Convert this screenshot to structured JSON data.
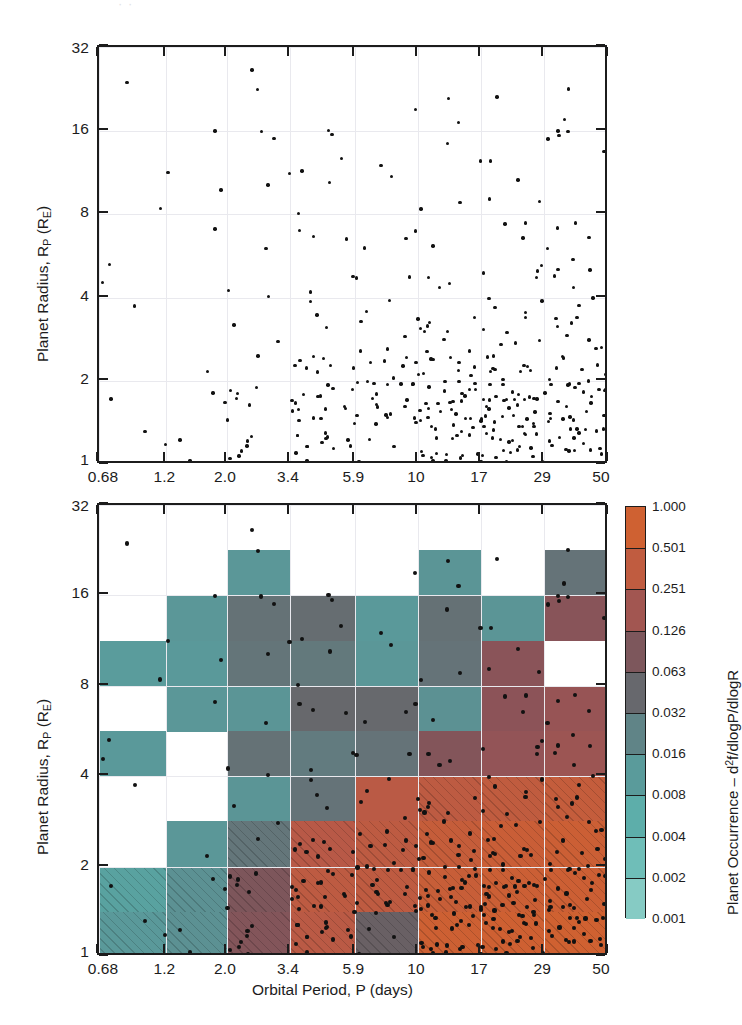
{
  "figure": {
    "panels": [
      {
        "id": "scatter-panel",
        "role": "planet radius vs orbital period scatter",
        "xlabel": "",
        "ylabel": "Planet Radius, R_P (R_E)"
      },
      {
        "id": "occurrence-panel",
        "role": "binned planet occurrence heatmap with scatter overlay",
        "xlabel": "Orbital Period, P (days)",
        "ylabel": "Planet Radius, R_P (R_E)"
      }
    ],
    "ylabel_parts": {
      "main": "Planet Radius, R",
      "sub1": "P",
      "paren_open": " (R",
      "sub2": "E",
      "paren_close": ")"
    },
    "xlabel": "Orbital Period, P (days)",
    "colorbar_title_parts": {
      "main": "Planet Occurrence ",
      "dash": "– d",
      "sup": "2",
      "tail": "f/dlogP/dlogR"
    }
  },
  "axes": {
    "x_ticklabels": [
      "0.68",
      "1.2",
      "2.0",
      "3.4",
      "5.9",
      "10",
      "17",
      "29",
      "50"
    ],
    "x_tickvalues": [
      0.68,
      1.2,
      2.0,
      3.4,
      5.9,
      10,
      17,
      29,
      50
    ],
    "y_ticklabels": [
      "32",
      "16",
      "8",
      "4",
      "2",
      "1"
    ],
    "y_tickvalues": [
      32,
      16,
      8,
      4,
      2,
      1
    ],
    "xscale": "log",
    "yscale": "log",
    "xlim": [
      0.68,
      50
    ],
    "ylim": [
      1,
      32
    ],
    "grid": true
  },
  "colorbar": {
    "title": "Planet Occurrence – d2f/dlogP/dlogR",
    "scale": "log",
    "labels": [
      "1.000",
      "0.501",
      "0.251",
      "0.126",
      "0.063",
      "0.032",
      "0.016",
      "0.008",
      "0.004",
      "0.002",
      "0.001"
    ],
    "values": [
      1.0,
      0.501,
      0.251,
      0.126,
      0.063,
      0.032,
      0.016,
      0.008,
      0.004,
      0.002,
      0.001
    ],
    "colors": [
      "#d2622f",
      "#c85f35",
      "#b4584a",
      "#8f5358",
      "#6a5a5f",
      "#64767a",
      "#5c9193",
      "#58a5a3",
      "#62b6b0",
      "#7cc6bf"
    ],
    "low_color": "#8fd0c8",
    "high_color": "#d2622f",
    "empty_color": "#ffffff"
  },
  "chart_data": {
    "type": "heatmap",
    "title": "",
    "xlabel": "Orbital Period, P (days)",
    "ylabel": "Planet Radius, R_P (R_E)",
    "xlim": [
      0.68,
      50
    ],
    "ylim": [
      1,
      32
    ],
    "grid": true,
    "legend": "colorbar-right",
    "x_bin_edges": [
      0.68,
      1.2,
      2.0,
      3.4,
      5.9,
      10,
      17,
      29,
      50
    ],
    "y_bin_edges": [
      1.0,
      1.41,
      2.0,
      2.83,
      4.0,
      5.66,
      8.0,
      11.3,
      16.0,
      22.6,
      32.0
    ],
    "z_label": "Planet Occurrence – d2f/dlogP/dlogR",
    "z_scale": "log",
    "z_range": [
      0.001,
      1.0
    ],
    "note": "values are occurrence density per log-period per log-radius bin; null = empty bin (white)",
    "rows_top_to_bottom": [
      {
        "y_bin": "22.6-32",
        "values": [
          null,
          null,
          null,
          null,
          null,
          null,
          null,
          null
        ]
      },
      {
        "y_bin": "16-22.6",
        "values": [
          null,
          null,
          0.013,
          null,
          null,
          0.014,
          null,
          0.034
        ]
      },
      {
        "y_bin": "11.3-16",
        "values": [
          null,
          0.013,
          0.035,
          0.04,
          0.012,
          0.036,
          0.014,
          0.11
        ]
      },
      {
        "y_bin": "8-11.3",
        "values": [
          0.011,
          0.012,
          0.033,
          0.03,
          0.013,
          0.034,
          0.115,
          null
        ]
      },
      {
        "y_bin": "5.66-8",
        "values": [
          null,
          0.013,
          0.014,
          0.045,
          0.044,
          0.016,
          0.12,
          0.145
        ]
      },
      {
        "y_bin": "4-5.66",
        "values": [
          0.012,
          null,
          0.035,
          0.028,
          0.034,
          0.1,
          0.135,
          0.16
        ]
      },
      {
        "y_bin": "2.83-4",
        "values": [
          null,
          null,
          0.014,
          0.034,
          0.3,
          0.33,
          0.36,
          0.4
        ]
      },
      {
        "y_bin": "2-2.83",
        "values": [
          null,
          0.013,
          0.032,
          0.28,
          0.33,
          0.42,
          0.47,
          0.52
        ]
      },
      {
        "y_bin": "1.41-2",
        "values": [
          0.009,
          0.016,
          0.09,
          0.33,
          0.34,
          0.45,
          0.52,
          0.56
        ]
      },
      {
        "y_bin": "1-1.41",
        "values": [
          0.012,
          0.016,
          0.1,
          0.3,
          0.055,
          0.62,
          0.7,
          0.78
        ]
      }
    ],
    "hatched_bins": "low-completeness bins: bottom two radius rows across all periods, plus long-period bins at radius < 2.8",
    "overlay": {
      "type": "scatter",
      "name": "detected planets",
      "n_points": 420,
      "marker": "filled circle",
      "color": "#111111"
    }
  },
  "scatter_top": {
    "type": "scatter",
    "name": "Kepler planet candidates",
    "n_points": 420,
    "marker_color": "#111111",
    "xlabel": "",
    "ylabel": "Planet Radius, R_P (R_E)"
  },
  "header_ghost": "· ·"
}
